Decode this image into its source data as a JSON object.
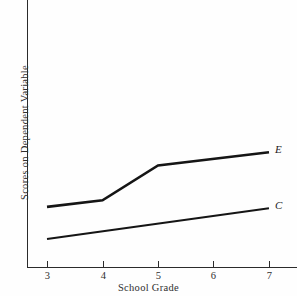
{
  "chart_data": {
    "type": "line",
    "title": "",
    "xlabel": "School Grade",
    "ylabel": "Scores on Dependent Variable",
    "x": [
      3,
      4,
      5,
      6,
      7
    ],
    "xticklabels": [
      "3",
      "4",
      "5",
      "6",
      "7"
    ],
    "xlim": [
      3,
      7
    ],
    "ylim": [
      0,
      1
    ],
    "yticklabels": [],
    "grid": false,
    "legend_position": "right-end-of-line",
    "series": [
      {
        "name": "E",
        "label": "E",
        "color": "#151515",
        "linewidth": 2.6,
        "x": [
          3,
          4,
          5,
          7
        ],
        "values": [
          0.225,
          0.25,
          0.38,
          0.43
        ]
      },
      {
        "name": "C",
        "label": "C",
        "color": "#151515",
        "linewidth": 1.9,
        "x": [
          3,
          7
        ],
        "values": [
          0.105,
          0.22
        ]
      }
    ],
    "annotations": [
      "E",
      "C"
    ]
  },
  "colors": {
    "background": "#fefefe",
    "axis": "#2b2b2b",
    "line": "#151515",
    "text": "#2f2f2f"
  }
}
